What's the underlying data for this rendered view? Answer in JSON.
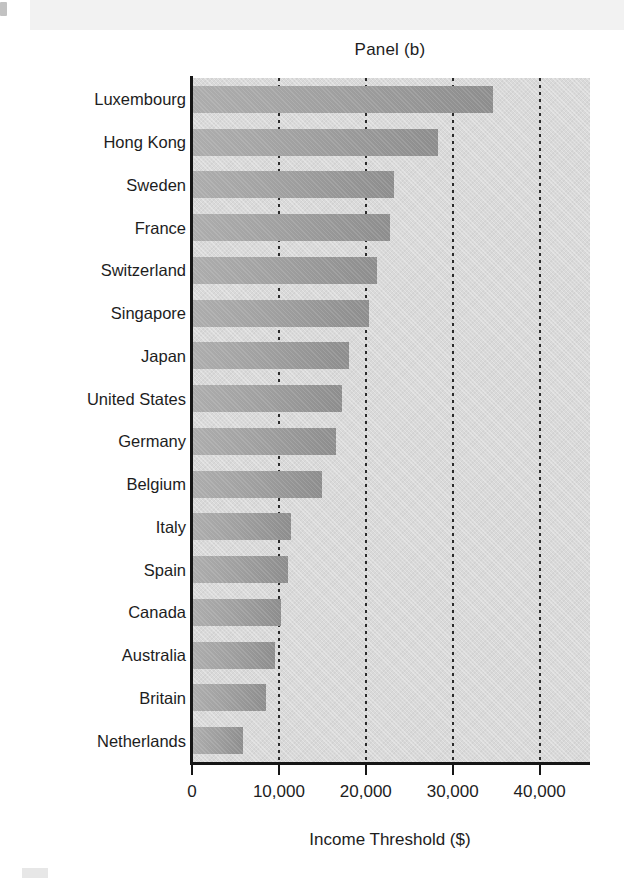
{
  "chart_data": {
    "type": "bar",
    "orientation": "horizontal",
    "title": "Panel (b)",
    "xlabel": "Income Threshold ($)",
    "ylabel": "",
    "xlim": [
      0,
      45800
    ],
    "xticks": [
      0,
      10000,
      20000,
      30000,
      40000
    ],
    "xtick_labels": [
      "0",
      "10,000",
      "20,000",
      "30,000",
      "40,000"
    ],
    "grid": true,
    "grid_axis": "x",
    "grid_style": "dotted",
    "legend": false,
    "categories": [
      "Luxembourg",
      "Hong Kong",
      "Sweden",
      "France",
      "Switzerland",
      "Singapore",
      "Japan",
      "United States",
      "Germany",
      "Belgium",
      "Italy",
      "Spain",
      "Canada",
      "Australia",
      "Britain",
      "Netherlands"
    ],
    "values": [
      34500,
      28200,
      23100,
      22700,
      21200,
      20300,
      18000,
      17200,
      16500,
      14900,
      11300,
      10900,
      10100,
      9400,
      8400,
      5800
    ],
    "value_labels": [
      "34,500",
      "28,200",
      "23,100",
      "22,700",
      "21,200",
      "20,300",
      "18,000",
      "17,200",
      "16,500",
      "14,900",
      "11,300",
      "10,900",
      "10,100",
      "9,400",
      "8,400",
      "5,800"
    ]
  },
  "colors": {
    "plot_background": "#d9d9d9",
    "bar_light": "#adadad",
    "bar_dark": "#8d8d8d",
    "axis": "#161616",
    "text": "#1d1d1d",
    "page_background": "#ffffff"
  }
}
